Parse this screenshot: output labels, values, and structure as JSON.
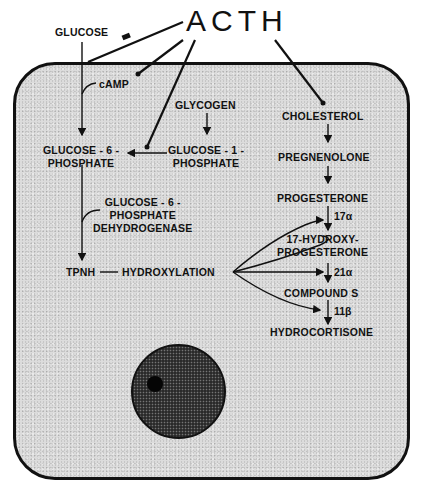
{
  "diagram": {
    "hormone": "ACTH",
    "outside_labels": {
      "glucose": "GLUCOSE"
    },
    "cell": {
      "camp": "cAMP",
      "glycogen": "GLYCOGEN",
      "g6p": [
        "GLUCOSE - 6 -",
        "PHOSPHATE"
      ],
      "g1p": [
        "GLUCOSE - 1 -",
        "PHOSPHATE"
      ],
      "g6pd": [
        "GLUCOSE - 6 -",
        "PHOSPHATE",
        "DEHYDROGENASE"
      ],
      "tpnh": "TPNH",
      "hydroxylation": "HYDROXYLATION",
      "steroid_pathway": [
        "CHOLESTEROL",
        "PREGNENOLONE",
        "PROGESTERONE",
        [
          "17-HYDROXY-",
          "PROGESTERONE"
        ],
        "COMPOUND S",
        "HYDROCORTISONE"
      ],
      "enzymes": {
        "e17": "17α",
        "e21": "21α",
        "e11": "11β"
      }
    },
    "colors": {
      "ink": "#111111",
      "cytoplasm": "#dcdcdc",
      "nucleus": "#2a2a2a"
    }
  }
}
